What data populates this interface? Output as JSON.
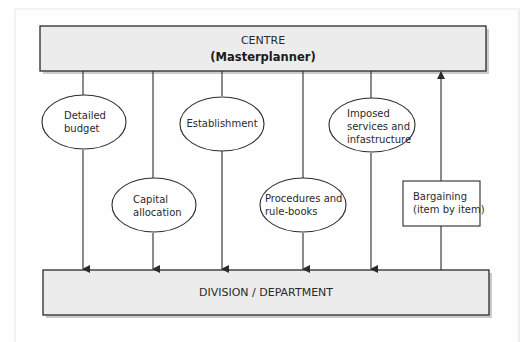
{
  "diagram": {
    "centre": {
      "title": "CENTRE",
      "subtitle": "(Masterplanner)"
    },
    "division": {
      "title": "DIVISION / DEPARTMENT"
    },
    "nodes": [
      {
        "shape": "ellipse",
        "lines": [
          "Detailed",
          "budget"
        ],
        "direction": "down"
      },
      {
        "shape": "ellipse",
        "lines": [
          "Capital",
          "allocation"
        ],
        "direction": "down"
      },
      {
        "shape": "ellipse",
        "lines": [
          "Establishment"
        ],
        "direction": "down"
      },
      {
        "shape": "ellipse",
        "lines": [
          "Procedures and",
          "rule-books"
        ],
        "direction": "down"
      },
      {
        "shape": "ellipse",
        "lines": [
          "Imposed",
          "services and",
          "infastructure"
        ],
        "direction": "down"
      },
      {
        "shape": "rectangle",
        "lines": [
          "Bargaining",
          "(item by item)"
        ],
        "direction": "up"
      }
    ],
    "colors": {
      "box_fill": "#ececec",
      "stroke": "#2b2b2b",
      "shadow": "#9a9a9a",
      "background": "#ffffff"
    }
  }
}
